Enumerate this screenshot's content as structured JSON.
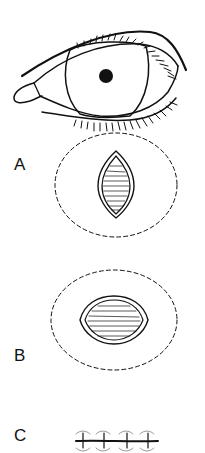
{
  "figure": {
    "type": "medical-illustration",
    "line_color": "#111111",
    "background": "#ffffff"
  },
  "panels": [
    {
      "id": "eye",
      "label": "",
      "description": "Eye with upper and lower eyelashes, iris and pupil"
    },
    {
      "id": "A",
      "label": "A",
      "description": "Vertical elliptical (lens-shaped) excision with striated base, surrounded by dashed undermining boundary"
    },
    {
      "id": "B",
      "label": "B",
      "description": "Wound widened into rounded shape after undermining, surrounded by dashed oval boundary"
    },
    {
      "id": "C",
      "label": "C",
      "description": "Closed linear wound with four interrupted sutures"
    }
  ],
  "labels": {
    "a": "A",
    "b": "B",
    "c": "C"
  }
}
